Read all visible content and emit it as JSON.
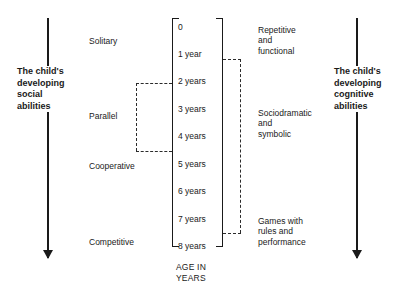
{
  "diagram": {
    "left_axis": {
      "caption": "The child's developing social abilities",
      "caption_lines": [
        "The child's",
        "developing",
        "social",
        "abilities"
      ],
      "direction": "downward-arrow"
    },
    "right_axis": {
      "caption": "The child's developing cognitive abilities",
      "caption_lines": [
        "The child's",
        "developing",
        "cognitive",
        "abilities"
      ],
      "direction": "downward-arrow"
    },
    "social_play_types": [
      {
        "label": "Solitary",
        "top": 36
      },
      {
        "label": "Parallel",
        "top": 111
      },
      {
        "label": "Cooperative",
        "top": 161
      },
      {
        "label": "Competitive",
        "top": 237
      }
    ],
    "age_axis": {
      "caption_line1": "AGE IN",
      "caption_line2": "YEARS",
      "ticks": [
        {
          "label": "0",
          "top": 22
        },
        {
          "label": "1 year",
          "top": 49
        },
        {
          "label": "2 years",
          "top": 76
        },
        {
          "label": "3 years",
          "top": 104
        },
        {
          "label": "4 years",
          "top": 131
        },
        {
          "label": "5 years",
          "top": 159
        },
        {
          "label": "6 years",
          "top": 186
        },
        {
          "label": "7 years",
          "top": 214
        },
        {
          "label": "8 years",
          "top": 241
        }
      ]
    },
    "cognitive_play_content": [
      {
        "lines": [
          "Repetitive",
          "and",
          "functional"
        ],
        "top": 25
      },
      {
        "lines": [
          "Sociodramatic",
          "and",
          "symbolic"
        ],
        "top": 108
      },
      {
        "lines": [
          "Games with",
          "rules and",
          "performance"
        ],
        "top": 216
      }
    ],
    "overlap_brackets": [
      {
        "name": "parallel-span",
        "side": "left",
        "top": 83,
        "bottom": 151
      },
      {
        "name": "symbolic-span",
        "side": "right",
        "top": 59,
        "bottom": 233
      }
    ],
    "colors": {
      "ink": "#1a1a1a",
      "dashed": "#2b2b2b",
      "background": "#ffffff"
    }
  }
}
